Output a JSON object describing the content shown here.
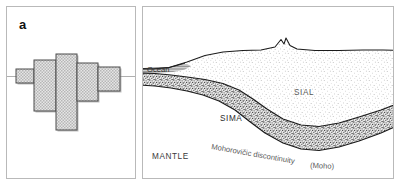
{
  "figure": {
    "panels": [
      {
        "id": "a",
        "label": "a",
        "caption_text": "a",
        "type": "isostasy-block-model",
        "description": "Blocks of differing height floating at differing levels relative to a common line"
      },
      {
        "id": "b",
        "label": "b",
        "caption_text": "b",
        "type": "crustal-cross-section",
        "description": "Cross section of ocean, sial, sima and mantle showing the Mohorovicic discontinuity"
      }
    ]
  },
  "panel_a": {
    "label": "a",
    "datum_line_name": "equilibrium-line",
    "blocks": [
      {
        "name": "block-1",
        "x": 14,
        "top": 68,
        "bottom": 82,
        "width": 18
      },
      {
        "name": "block-2",
        "x": 32,
        "top": 59,
        "bottom": 110,
        "width": 22
      },
      {
        "name": "block-3",
        "x": 54,
        "top": 53,
        "bottom": 129,
        "width": 21
      },
      {
        "name": "block-4",
        "x": 75,
        "top": 62,
        "bottom": 100,
        "width": 21
      },
      {
        "name": "block-5",
        "x": 96,
        "top": 66,
        "bottom": 90,
        "width": 22
      }
    ]
  },
  "panel_b": {
    "label": "b",
    "labels": {
      "ocean": "Ocean",
      "sial": "SIAL",
      "sima": "SIMA",
      "mantle": "MANTLE",
      "moho_line": "Mohorovičic discontinuity",
      "moho_paren": "(Moho)"
    }
  },
  "colors": {
    "panel_border": "#b9b9b9",
    "ink": "#111111",
    "label_gray": "#4a4a4a",
    "block_fill": "#e2e2e2",
    "block_stroke": "#555555",
    "block_shadow": "#8c8c8c",
    "sial_fill": "#fbfbfb",
    "sima_fill": "#c7c7c7",
    "background": "#ffffff"
  }
}
